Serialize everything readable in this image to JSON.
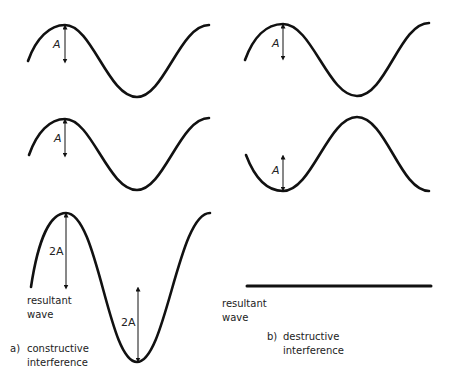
{
  "figure": {
    "panel_a": {
      "prefix": "a)",
      "caption_line1": "constructive",
      "caption_line2": "interference",
      "wave1_amplitude_label": "A",
      "wave2_amplitude_label": "A",
      "resultant_amplitude_label_top": "2A",
      "resultant_amplitude_label_bottom": "2A",
      "resultant_label_line1": "resultant",
      "resultant_label_line2": "wave"
    },
    "panel_b": {
      "prefix": "b)",
      "caption_line1": "destructive",
      "caption_line2": "interference",
      "wave1_amplitude_label": "A",
      "wave2_amplitude_label": "A",
      "resultant_label_line1": "resultant",
      "resultant_label_line2": "wave"
    },
    "stroke_color": "#111111"
  }
}
